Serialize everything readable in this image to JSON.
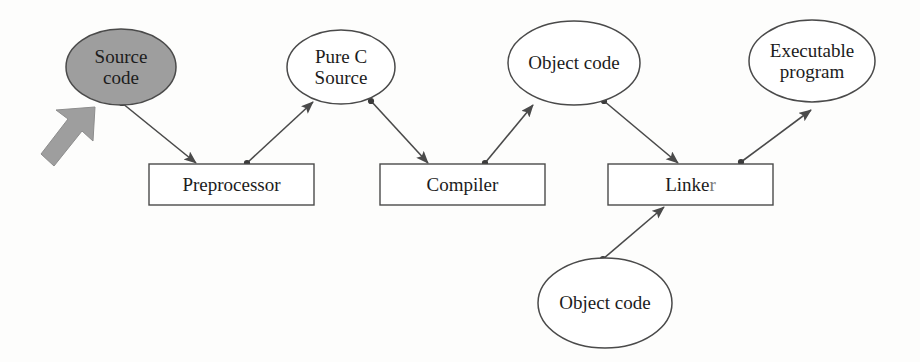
{
  "diagram": {
    "colors": {
      "stroke": "#3b3b3b",
      "highlight_fill": "#9e9e9e",
      "arrow_marker_fill": "#9b9b9b",
      "node_fill": "#ffffff",
      "text": "#1c1c1c",
      "background": "#fdfdfc"
    },
    "nodes": [
      {
        "id": "source-code",
        "shape": "ellipse",
        "label": "Source\ncode",
        "line1": "Source",
        "line2": "code",
        "highlighted": true,
        "cx": 121,
        "cy": 67,
        "rx": 55,
        "ry": 38
      },
      {
        "id": "pure-c-source",
        "shape": "ellipse",
        "label": "Pure C\nSource",
        "line1": "Pure C",
        "line2": "Source",
        "highlighted": false,
        "cx": 341,
        "cy": 67,
        "rx": 54,
        "ry": 37
      },
      {
        "id": "object-code-top",
        "shape": "ellipse",
        "label": "Object code",
        "line1": "Object code",
        "line2": "",
        "highlighted": false,
        "cx": 574,
        "cy": 63,
        "rx": 66,
        "ry": 42
      },
      {
        "id": "executable-program",
        "shape": "ellipse",
        "label": "Executable\nprogram",
        "line1": "Executable",
        "line2": "program",
        "highlighted": false,
        "cx": 812,
        "cy": 61,
        "rx": 63,
        "ry": 41
      },
      {
        "id": "object-code-bottom",
        "shape": "ellipse",
        "label": "Object code",
        "line1": "Object code",
        "line2": "",
        "highlighted": false,
        "cx": 605,
        "cy": 303,
        "rx": 67,
        "ry": 45
      },
      {
        "id": "preprocessor",
        "shape": "box",
        "label": "Preprocessor",
        "x": 149,
        "y": 164,
        "w": 165,
        "h": 41
      },
      {
        "id": "compiler",
        "shape": "box",
        "label": "Compiler",
        "x": 380,
        "y": 164,
        "w": 165,
        "h": 41
      },
      {
        "id": "linker",
        "shape": "box",
        "label": "Linker",
        "label_visible": "Linke",
        "label_faded_tail": "r",
        "x": 608,
        "y": 164,
        "w": 165,
        "h": 41
      }
    ],
    "edges": [
      {
        "id": "source-to-preprocessor",
        "from": "source-code",
        "to": "preprocessor",
        "x1": 122,
        "y1": 103,
        "x2": 196,
        "y2": 163
      },
      {
        "id": "preprocessor-to-pure-c",
        "from": "preprocessor",
        "to": "pure-c-source",
        "x1": 247,
        "y1": 163,
        "x2": 313,
        "y2": 101
      },
      {
        "id": "pure-c-to-compiler",
        "from": "pure-c-source",
        "to": "compiler",
        "x1": 371,
        "y1": 101,
        "x2": 428,
        "y2": 163
      },
      {
        "id": "compiler-to-object-code",
        "from": "compiler",
        "to": "object-code-top",
        "x1": 485,
        "y1": 163,
        "x2": 533,
        "y2": 104
      },
      {
        "id": "object-code-to-linker",
        "from": "object-code-top",
        "to": "linker",
        "x1": 604,
        "y1": 101,
        "x2": 678,
        "y2": 163
      },
      {
        "id": "linker-to-executable",
        "from": "linker",
        "to": "executable-program",
        "x1": 741,
        "y1": 162,
        "x2": 811,
        "y2": 110
      },
      {
        "id": "object-code-bottom-to-linker",
        "from": "object-code-bottom",
        "to": "linker",
        "x1": 603,
        "y1": 259,
        "x2": 664,
        "y2": 206
      }
    ],
    "annotation": {
      "id": "highlight-arrow",
      "type": "block-arrow",
      "points_to": "source-code",
      "direction": "up-right",
      "fill": "#9e9e9e",
      "x": 41,
      "y": 108,
      "w": 54,
      "h": 58
    }
  }
}
